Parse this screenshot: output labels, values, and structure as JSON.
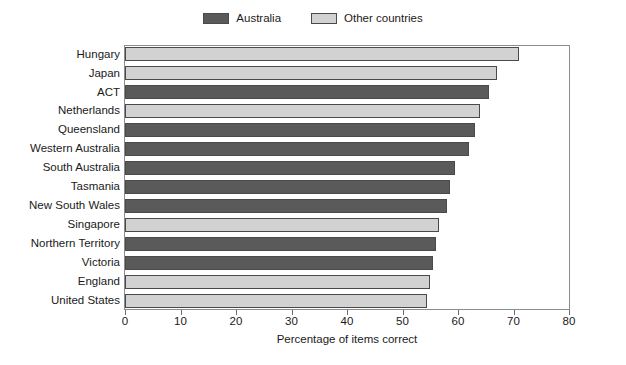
{
  "chart_data": {
    "type": "bar",
    "orientation": "horizontal",
    "title": "",
    "xlabel": "Percentage of items correct",
    "ylabel": "",
    "xlim": [
      0,
      80
    ],
    "xticks": [
      0,
      10,
      20,
      30,
      40,
      50,
      60,
      70,
      80
    ],
    "grid": false,
    "legend_position": "top-center",
    "categories": [
      "Hungary",
      "Japan",
      "ACT",
      "Netherlands",
      "Queensland",
      "Western Australia",
      "South Australia",
      "Tasmania",
      "New South Wales",
      "Singapore",
      "Northern Territory",
      "Victoria",
      "England",
      "United States"
    ],
    "values": [
      71.0,
      67.0,
      65.5,
      64.0,
      63.0,
      62.0,
      59.5,
      58.5,
      58.0,
      56.5,
      56.0,
      55.5,
      55.0,
      54.5
    ],
    "groups": [
      "Other countries",
      "Other countries",
      "Australia",
      "Other countries",
      "Australia",
      "Australia",
      "Australia",
      "Australia",
      "Australia",
      "Other countries",
      "Australia",
      "Australia",
      "Other countries",
      "Other countries"
    ],
    "series": [
      {
        "name": "Australia",
        "color": "#5a5a5a",
        "points": [
          {
            "category": "ACT",
            "value": 65.5
          },
          {
            "category": "Queensland",
            "value": 63.0
          },
          {
            "category": "Western Australia",
            "value": 62.0
          },
          {
            "category": "South Australia",
            "value": 59.5
          },
          {
            "category": "Tasmania",
            "value": 58.5
          },
          {
            "category": "New South Wales",
            "value": 58.0
          },
          {
            "category": "Northern Territory",
            "value": 56.0
          },
          {
            "category": "Victoria",
            "value": 55.5
          }
        ]
      },
      {
        "name": "Other countries",
        "color": "#d2d2d2",
        "points": [
          {
            "category": "Hungary",
            "value": 71.0
          },
          {
            "category": "Japan",
            "value": 67.0
          },
          {
            "category": "Netherlands",
            "value": 64.0
          },
          {
            "category": "Singapore",
            "value": 56.5
          },
          {
            "category": "England",
            "value": 55.0
          },
          {
            "category": "United States",
            "value": 54.5
          }
        ]
      }
    ]
  },
  "legend": {
    "items": [
      {
        "label": "Australia",
        "color": "#5a5a5a"
      },
      {
        "label": "Other countries",
        "color": "#d2d2d2"
      }
    ]
  },
  "axis": {
    "x_title": "Percentage of items correct",
    "tick_labels": [
      "0",
      "10",
      "20",
      "30",
      "40",
      "50",
      "60",
      "70",
      "80"
    ]
  },
  "colors": {
    "australia": "#5a5a5a",
    "other_countries": "#d2d2d2",
    "bar_border": "#4a4a4a",
    "frame": "#8c8c8c",
    "text": "#1a1a1a",
    "background": "#ffffff"
  }
}
